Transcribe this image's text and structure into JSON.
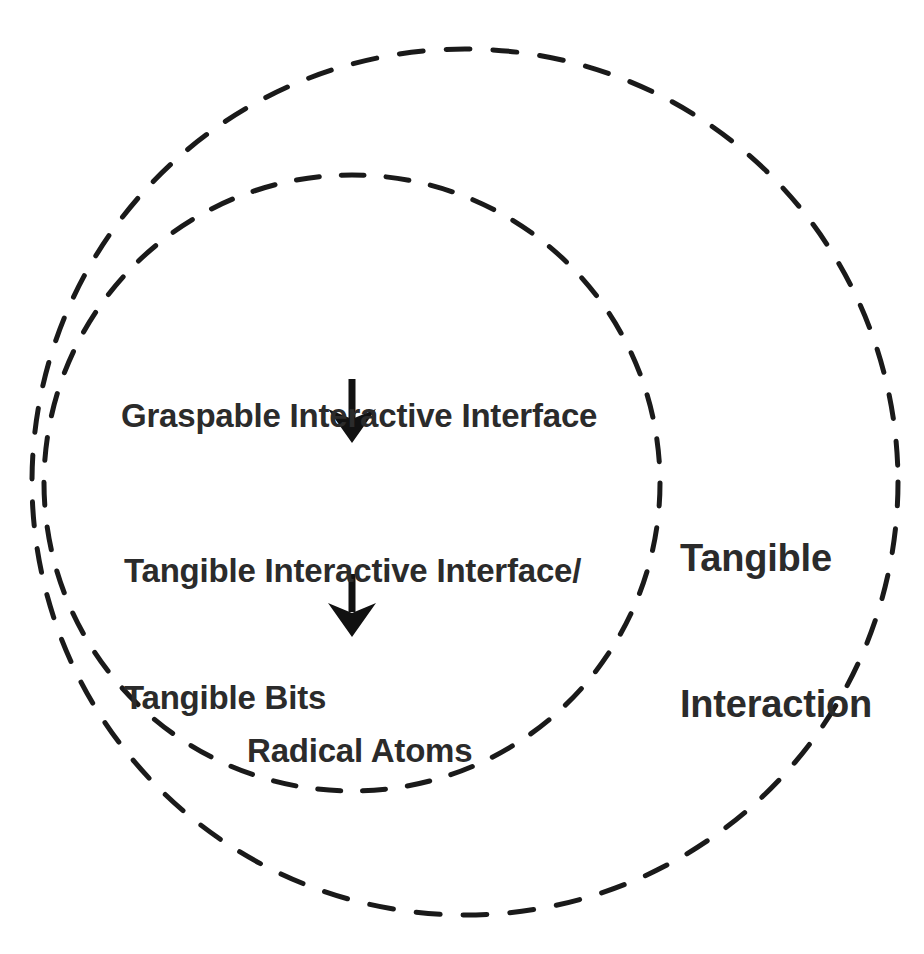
{
  "canvas": {
    "width": 924,
    "height": 954,
    "background_color": "#ffffff"
  },
  "diagram": {
    "type": "nested-venn-progression",
    "stroke_color": "#1a1a1a",
    "text_color": "#2b2b2b"
  },
  "circles": {
    "outer": {
      "name": "Tangible Interaction",
      "style": "dashed",
      "cx": 465,
      "cy": 482,
      "r": 433,
      "stroke_width": 5,
      "dash": "24 23"
    },
    "inner": {
      "name": "Tangible Interactive Interface group",
      "style": "dashed",
      "cx": 352,
      "cy": 483,
      "r": 308,
      "stroke_width": 5,
      "dash": "23 22"
    }
  },
  "labels": {
    "graspable": "Graspable Interactive Interface",
    "tangible_interface_line1": "Tangible Interactive Interface/",
    "tangible_interface_line2": "Tangible Bits",
    "radical_atoms": "Radical Atoms",
    "tangible_interaction_line1": "Tangible",
    "tangible_interaction_line2": "Interaction"
  },
  "arrows": [
    {
      "name": "arrow-graspable-to-tangible",
      "direction": "down",
      "x": 352,
      "y_start": 379,
      "y_end": 443
    },
    {
      "name": "arrow-tangible-to-radical",
      "direction": "down",
      "x": 352,
      "y_start": 574,
      "y_end": 637
    }
  ]
}
